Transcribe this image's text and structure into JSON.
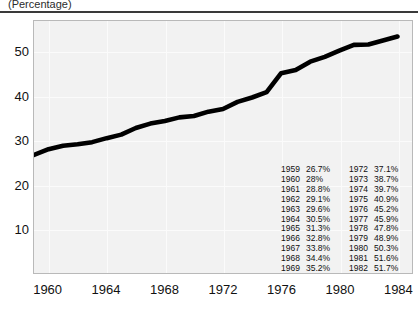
{
  "header": {
    "title": "(Percentage)"
  },
  "chart_data": {
    "type": "line",
    "title": "(Percentage)",
    "xlabel": "",
    "ylabel": "",
    "xlim": [
      1959,
      1985
    ],
    "ylim": [
      0,
      57
    ],
    "grid": true,
    "legend": false,
    "x": [
      1959,
      1960,
      1961,
      1962,
      1963,
      1964,
      1965,
      1966,
      1967,
      1968,
      1969,
      1970,
      1971,
      1972,
      1973,
      1974,
      1975,
      1976,
      1977,
      1978,
      1979,
      1980,
      1981,
      1982,
      1983,
      1984
    ],
    "values": [
      26.7,
      28.0,
      28.8,
      29.1,
      29.6,
      30.5,
      31.3,
      32.8,
      33.8,
      34.4,
      35.2,
      35.5,
      36.5,
      37.1,
      38.7,
      39.7,
      40.9,
      45.2,
      45.9,
      47.8,
      48.9,
      50.3,
      51.6,
      51.7,
      52.6,
      53.5
    ],
    "series": [
      {
        "name": "Percentage",
        "color": "#000000",
        "values": [
          26.7,
          28.0,
          28.8,
          29.1,
          29.6,
          30.5,
          31.3,
          32.8,
          33.8,
          34.4,
          35.2,
          35.5,
          36.5,
          37.1,
          38.7,
          39.7,
          40.9,
          45.2,
          45.9,
          47.8,
          48.9,
          50.3,
          51.6,
          51.7,
          52.6,
          53.5
        ]
      }
    ],
    "y_ticks": [
      "50",
      "40",
      "30",
      "20",
      "10"
    ],
    "y_tick_values": [
      50,
      40,
      30,
      20,
      10
    ],
    "x_ticks": [
      "1960",
      "1964",
      "1968",
      "1972",
      "1976",
      "1980",
      "1984"
    ],
    "x_tick_values": [
      1960,
      1964,
      1968,
      1972,
      1976,
      1980,
      1984
    ],
    "annotations": {
      "columns": [
        {
          "rows": [
            {
              "year": "1959",
              "value": "26.7%"
            },
            {
              "year": "1960",
              "value": "28%"
            },
            {
              "year": "1961",
              "value": "28.8%"
            },
            {
              "year": "1962",
              "value": "29.1%"
            },
            {
              "year": "1963",
              "value": "29.6%"
            },
            {
              "year": "1964",
              "value": "30.5%"
            },
            {
              "year": "1965",
              "value": "31.3%"
            },
            {
              "year": "1966",
              "value": "32.8%"
            },
            {
              "year": "1967",
              "value": "33.8%"
            },
            {
              "year": "1968",
              "value": "34.4%"
            },
            {
              "year": "1969",
              "value": "35.2%"
            },
            {
              "year": "1970",
              "value": "35.5%"
            },
            {
              "year": "1971",
              "value": "36.5%"
            }
          ]
        },
        {
          "rows": [
            {
              "year": "1972",
              "value": "37.1%"
            },
            {
              "year": "1973",
              "value": "38.7%"
            },
            {
              "year": "1974",
              "value": "39.7%"
            },
            {
              "year": "1975",
              "value": "40.9%"
            },
            {
              "year": "1976",
              "value": "45.2%"
            },
            {
              "year": "1977",
              "value": "45.9%"
            },
            {
              "year": "1978",
              "value": "47.8%"
            },
            {
              "year": "1979",
              "value": "48.9%"
            },
            {
              "year": "1980",
              "value": "50.3%"
            },
            {
              "year": "1981",
              "value": "51.6%"
            },
            {
              "year": "1982",
              "value": "51.7%"
            },
            {
              "year": "1983",
              "value": "52.6%"
            },
            {
              "year": "1984",
              "value": "53.5%"
            }
          ]
        }
      ]
    },
    "colors": {
      "line": "#000000",
      "plot_background": "#f2f2f2",
      "gridline": "#fbfbfb",
      "plot_border": "#b9b9b9",
      "rule": "#3a3a3a",
      "text": "#111111"
    }
  }
}
